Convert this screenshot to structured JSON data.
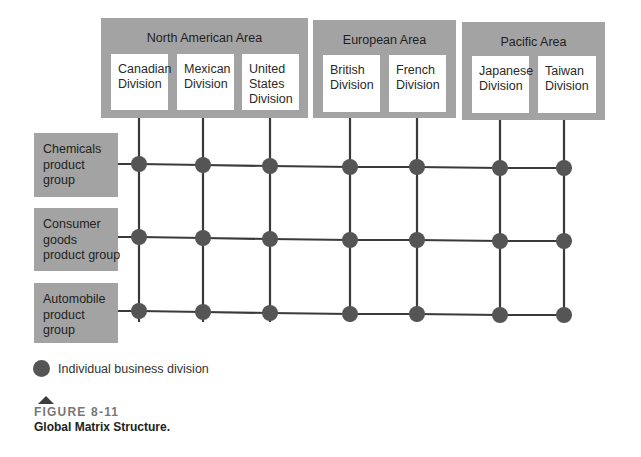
{
  "areas": [
    {
      "title": "North American Area",
      "divisions": [
        "Canadian\nDivision",
        "Mexican\nDivision",
        "United\nStates\nDivision"
      ]
    },
    {
      "title": "European Area",
      "divisions": [
        "British\nDivision",
        "French\nDivision"
      ]
    },
    {
      "title": "Pacific Area",
      "divisions": [
        "Japanese\nDivision",
        "Taiwan\nDivision"
      ]
    }
  ],
  "product_groups": [
    "Chemicals\nproduct\ngroup",
    "Consumer\ngoods\nproduct group",
    "Automobile\nproduct\ngroup"
  ],
  "grid": {
    "columns_x": [
      139,
      203,
      270,
      350,
      417,
      500,
      564
    ],
    "rows_y": [
      164,
      237,
      311
    ],
    "row_tilt": [
      0,
      1,
      2,
      3,
      3,
      4,
      4
    ],
    "node_color": "#555555",
    "line_color": "#3a3a3a"
  },
  "legend": {
    "label": "Individual business division"
  },
  "caption": {
    "figure_number": "FIGURE 8-11",
    "title": "Global Matrix Structure."
  },
  "colors": {
    "box_gray": "#a3a3a3",
    "node": "#555555"
  }
}
